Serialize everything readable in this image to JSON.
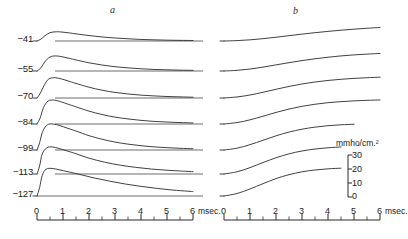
{
  "figure": {
    "panels": [
      {
        "id": "a",
        "label": "a"
      },
      {
        "id": "b",
        "label": "b"
      }
    ],
    "trace_labels": [
      "−41",
      "−55",
      "−70",
      "−84",
      "−99",
      "−113",
      "−127"
    ],
    "axis": {
      "tick_labels": [
        "0",
        "1",
        "2",
        "3",
        "4",
        "5",
        "6"
      ],
      "unit": "msec.",
      "min": 0,
      "max": 6
    },
    "scale": {
      "title": "mmho/cm.²",
      "ticks": [
        "30",
        "20",
        "10",
        "0"
      ],
      "values": [
        30,
        20,
        10,
        0
      ]
    },
    "ink_color": "#2b2b2b"
  },
  "chart_data": {
    "type": "line",
    "title": "",
    "subtitle": "",
    "xlabel": "msec.",
    "ylabel": "mmho/cm.²",
    "xlim": [
      0,
      6
    ],
    "ylim": [
      0,
      30
    ],
    "grid": false,
    "legend": "none",
    "panel_labels": [
      "a",
      "b"
    ],
    "series_labels": [
      "−41",
      "−55",
      "−70",
      "−84",
      "−99",
      "−113",
      "−127"
    ],
    "annotations": [
      "a",
      "b",
      "mmho/cm.²",
      "0",
      "10",
      "20",
      "30",
      "msec."
    ],
    "panels": [
      {
        "name": "a",
        "description": "transient rise-and-decay conductance curves",
        "series": [
          {
            "name": "−41",
            "x": [
              0,
              0.15,
              0.3,
              0.5,
              0.75,
              1.0,
              1.25,
              1.5,
              2.0,
              2.5,
              3.0,
              3.5,
              4.0,
              4.5,
              5.0,
              5.5,
              6.0
            ],
            "values": [
              0,
              1.4,
              4.0,
              6.4,
              7.1,
              6.8,
              6.2,
              5.5,
              4.2,
              3.1,
              2.3,
              1.7,
              1.2,
              0.9,
              0.65,
              0.5,
              0.4
            ]
          },
          {
            "name": "−55",
            "x": [
              0,
              0.15,
              0.3,
              0.5,
              0.75,
              1.0,
              1.25,
              1.5,
              2.0,
              2.5,
              3.0,
              3.5,
              4.0,
              4.5,
              5.0,
              5.5,
              6.0
            ],
            "values": [
              0,
              2.4,
              7.0,
              10.8,
              11.6,
              10.8,
              9.7,
              8.5,
              6.3,
              4.6,
              3.3,
              2.4,
              1.7,
              1.2,
              0.9,
              0.65,
              0.5
            ]
          },
          {
            "name": "−70",
            "x": [
              0,
              0.12,
              0.28,
              0.45,
              0.7,
              0.95,
              1.2,
              1.5,
              2.0,
              2.5,
              3.0,
              3.5,
              4.0,
              4.5,
              5.0,
              5.5,
              6.0
            ],
            "values": [
              0,
              3.4,
              9.8,
              14.6,
              15.6,
              14.6,
              13.1,
              11.2,
              8.3,
              6.0,
              4.3,
              3.1,
              2.2,
              1.6,
              1.15,
              0.85,
              0.6
            ]
          },
          {
            "name": "−84",
            "x": [
              0,
              0.12,
              0.25,
              0.42,
              0.65,
              0.9,
              1.2,
              1.5,
              2.0,
              2.5,
              3.0,
              3.5,
              4.0,
              4.5,
              5.0,
              5.5,
              6.0
            ],
            "values": [
              0,
              4.6,
              12.6,
              17.6,
              18.4,
              17.2,
              15.2,
              13.2,
              9.9,
              7.3,
              5.3,
              3.9,
              2.8,
              2.0,
              1.5,
              1.1,
              0.8
            ]
          },
          {
            "name": "−99",
            "x": [
              0,
              0.1,
              0.22,
              0.4,
              0.62,
              0.88,
              1.15,
              1.5,
              2.0,
              2.5,
              3.0,
              3.5,
              4.0,
              4.5,
              5.0,
              5.5,
              6.0
            ],
            "values": [
              0,
              5.6,
              14.4,
              19.4,
              20.0,
              18.8,
              16.9,
              14.6,
              11.0,
              8.3,
              6.1,
              4.5,
              3.3,
              2.4,
              1.8,
              1.3,
              1.0
            ]
          },
          {
            "name": "−113",
            "x": [
              0,
              0.1,
              0.2,
              0.38,
              0.6,
              0.85,
              1.15,
              1.5,
              2.0,
              2.6,
              3.2,
              3.8,
              4.4,
              5.0,
              5.6,
              6.0
            ],
            "values": [
              0,
              6.2,
              15.4,
              20.2,
              20.8,
              19.6,
              17.8,
              15.6,
              12.2,
              9.1,
              6.8,
              5.1,
              3.8,
              2.9,
              2.2,
              1.8
            ]
          },
          {
            "name": "−127",
            "x": [
              0,
              0.1,
              0.2,
              0.35,
              0.58,
              0.85,
              1.2,
              1.6,
              2.2,
              2.8,
              3.4,
              4.0,
              4.6,
              5.2,
              5.8,
              6.0
            ],
            "values": [
              0,
              6.5,
              15.8,
              20.6,
              21.2,
              20.2,
              18.6,
              16.8,
              13.9,
              11.4,
              9.2,
              7.4,
              5.9,
              4.6,
              3.7,
              3.4
            ]
          }
        ]
      },
      {
        "name": "b",
        "description": "sigmoid rising conductance curves",
        "series": [
          {
            "name": "−41",
            "x": [
              0,
              0.5,
              1.0,
              1.5,
              2.0,
              2.5,
              3.0,
              3.5,
              4.0,
              4.5,
              5.0,
              5.5,
              6.0
            ],
            "values": [
              0,
              0.3,
              0.9,
              1.8,
              2.9,
              4.1,
              5.3,
              6.4,
              7.4,
              8.3,
              9.1,
              9.8,
              10.4
            ]
          },
          {
            "name": "−55",
            "x": [
              0,
              0.5,
              1.0,
              1.5,
              2.0,
              2.5,
              3.0,
              3.5,
              4.0,
              4.5,
              5.0,
              5.5,
              6.0
            ],
            "values": [
              0,
              0.5,
              1.5,
              3.0,
              4.7,
              6.4,
              8.0,
              9.4,
              10.6,
              11.6,
              12.4,
              13.0,
              13.5
            ]
          },
          {
            "name": "−70",
            "x": [
              0,
              0.5,
              1.0,
              1.5,
              2.0,
              2.5,
              3.0,
              3.5,
              4.0,
              4.5,
              5.0,
              5.5,
              6.0
            ],
            "values": [
              0,
              0.8,
              2.3,
              4.4,
              6.7,
              8.9,
              10.8,
              12.3,
              13.5,
              14.4,
              15.1,
              15.6,
              16.0
            ]
          },
          {
            "name": "−84",
            "x": [
              0,
              0.5,
              1.0,
              1.5,
              2.0,
              2.5,
              3.0,
              3.5,
              4.0,
              4.5,
              5.0,
              5.5,
              6.0
            ],
            "values": [
              0,
              1.1,
              3.2,
              6.0,
              8.9,
              11.5,
              13.6,
              15.2,
              16.4,
              17.2,
              17.8,
              18.2,
              18.5
            ]
          },
          {
            "name": "−99",
            "x": [
              0,
              0.5,
              1.0,
              1.5,
              2.0,
              2.5,
              3.0,
              3.5,
              4.0,
              4.5,
              5.0
            ],
            "values": [
              0,
              1.4,
              4.1,
              7.5,
              10.9,
              13.8,
              16.0,
              17.6,
              18.7,
              19.4,
              19.8
            ]
          },
          {
            "name": "−113",
            "x": [
              0,
              0.5,
              1.0,
              1.5,
              2.0,
              2.5,
              3.0,
              3.5,
              4.0,
              4.5
            ],
            "values": [
              0,
              1.7,
              4.9,
              8.8,
              12.5,
              15.5,
              17.7,
              19.2,
              20.2,
              20.8
            ]
          },
          {
            "name": "−127",
            "x": [
              0,
              0.5,
              1.0,
              1.5,
              2.0,
              2.5,
              3.0,
              3.5,
              4.0,
              4.5
            ],
            "values": [
              0,
              1.9,
              5.4,
              9.5,
              13.4,
              16.4,
              18.6,
              20.0,
              20.9,
              21.4
            ]
          }
        ]
      }
    ]
  }
}
